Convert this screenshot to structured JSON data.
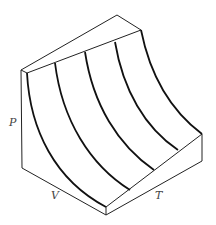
{
  "diagram": {
    "axes": {
      "p_label": "P",
      "v_label": "V",
      "t_label": "T"
    },
    "isotherm_count": 5,
    "colors": {
      "stroke": "#222222",
      "label": "#444444",
      "background": "#ffffff"
    }
  }
}
